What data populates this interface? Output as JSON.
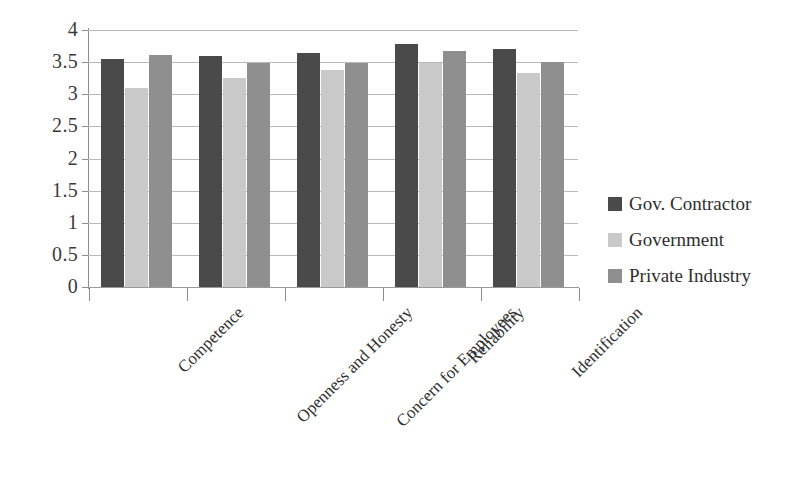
{
  "chart_data": {
    "type": "bar",
    "title": "",
    "subtitle": "",
    "xlabel": "",
    "ylabel": "",
    "ylim": [
      0,
      4
    ],
    "ytick_labels": [
      "4",
      "3.5",
      "3",
      "2.5",
      "2",
      "1.5",
      "1",
      "0.5",
      "0"
    ],
    "ytick_values": [
      4,
      3.5,
      3,
      2.5,
      2,
      1.5,
      1,
      0.5,
      0
    ],
    "grid": true,
    "legend_position": "right",
    "categories": [
      "Competence",
      "Openness and Honesty",
      "Concern for Employees",
      "Reliability",
      "Identification"
    ],
    "series": [
      {
        "name": "Gov. Contractor",
        "color": "#4a4a4a",
        "values": [
          3.55,
          3.6,
          3.65,
          3.79,
          3.7
        ]
      },
      {
        "name": "Government",
        "color": "#c9c9c9",
        "values": [
          3.1,
          3.25,
          3.38,
          3.49,
          3.33
        ]
      },
      {
        "name": "Private Industry",
        "color": "#8f8f8f",
        "values": [
          3.61,
          3.48,
          3.48,
          3.68,
          3.5
        ]
      }
    ]
  },
  "colors": {
    "gridline": "#b9b9b9",
    "axis": "#8d8d8d",
    "text": "#2f2f2f",
    "background": "#ffffff"
  }
}
